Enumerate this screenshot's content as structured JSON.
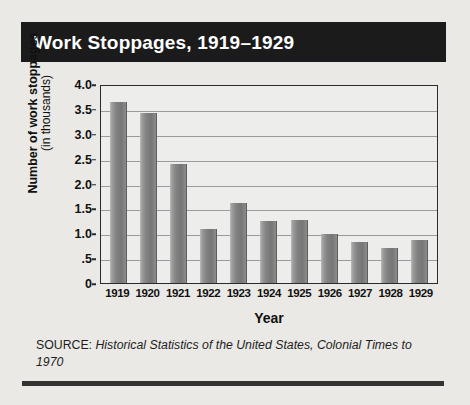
{
  "title": "Work Stoppages, 1919–1929",
  "source": {
    "label": "SOURCE:",
    "citation": "Historical Statistics of the United States, Colonial Times to 1970"
  },
  "colors": {
    "title_bar_background": "#1b1b1b",
    "title_text": "#ffffff",
    "page_background": "#eae9e5",
    "plot_background": "#ededeb",
    "bar_fill": "#7e7e7e",
    "gridline": "#9a9a9a",
    "axis": "#2a2a2a",
    "rule": "#333333"
  },
  "chart_data": {
    "type": "bar",
    "title": "Work Stoppages, 1919–1929",
    "subtitle": "",
    "xlabel": "Year",
    "ylabel": "Number of work stoppages (in thousands)",
    "ylabel_main": "Number of work stoppages",
    "ylabel_sub": "(in thousands)",
    "categories": [
      "1919",
      "1920",
      "1921",
      "1922",
      "1923",
      "1924",
      "1925",
      "1926",
      "1927",
      "1928",
      "1929"
    ],
    "values": [
      3.63,
      3.41,
      2.39,
      1.09,
      1.61,
      1.25,
      1.26,
      0.98,
      0.83,
      0.71,
      0.87
    ],
    "ylim": [
      0,
      4.0
    ],
    "yticks": [
      0,
      0.5,
      1.0,
      1.5,
      2.0,
      2.5,
      3.0,
      3.5,
      4.0
    ],
    "ytick_labels": [
      "0",
      ".5",
      "1.0",
      "1.5",
      "2.0",
      "2.5",
      "3.0",
      "3.5",
      "4.0"
    ],
    "grid": true,
    "grid_axis": "y",
    "legend": false,
    "legend_position": "none",
    "bar_color": "#7e7e7e",
    "annotations": []
  }
}
